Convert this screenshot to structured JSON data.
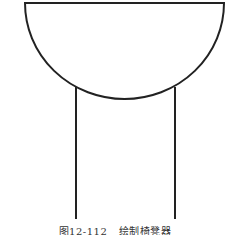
{
  "figure": {
    "stroke_color": "#222222",
    "bowl": {
      "left": 25,
      "right": 224,
      "top": 3,
      "bottom": 99
    },
    "legs": [
      {
        "x": 76,
        "y1": 87,
        "y2": 219
      },
      {
        "x": 175,
        "y1": 87,
        "y2": 219
      }
    ]
  },
  "caption": {
    "number": "图12-112",
    "title": "绘制椅凳器"
  }
}
